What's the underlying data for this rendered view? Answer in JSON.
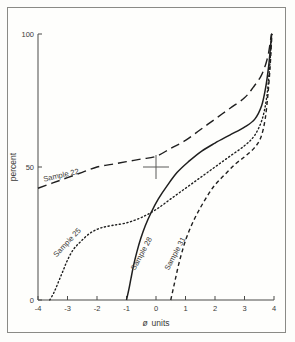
{
  "figure": {
    "border": true,
    "background_color": "#fefefc",
    "ink_color": "#1f1f1f"
  },
  "chart_data": {
    "type": "line",
    "title": "",
    "xlabel": "ø  units",
    "ylabel": "percent",
    "xlim": [
      -4,
      4
    ],
    "ylim": [
      0,
      100
    ],
    "grid": false,
    "legend_position": "inline-curve-labels",
    "x_ticks": [
      -4,
      -3,
      -2,
      -1,
      0,
      1,
      2,
      3,
      4
    ],
    "x_tick_labels": [
      "-4",
      "-3",
      "-2",
      "-1",
      "0",
      "1",
      "2",
      "3",
      "4"
    ],
    "y_ticks": [
      0,
      50,
      100
    ],
    "y_tick_labels": [
      "0",
      "50",
      "100"
    ],
    "annotations": [
      {
        "name": "crosshair-marker",
        "x": 0.0,
        "y": 50,
        "shape": "plus"
      }
    ],
    "series": [
      {
        "name": "Sample 22",
        "label": "Sample 22",
        "style": "long-dash",
        "label_x": -3.2,
        "label_y": 46,
        "label_rotation": -13,
        "points": [
          [
            -4.0,
            42
          ],
          [
            -3.5,
            44
          ],
          [
            -3.0,
            46
          ],
          [
            -2.5,
            48
          ],
          [
            -2.0,
            50
          ],
          [
            -1.5,
            51
          ],
          [
            -1.0,
            52
          ],
          [
            -0.5,
            53
          ],
          [
            0.0,
            54
          ],
          [
            0.5,
            57
          ],
          [
            1.0,
            60
          ],
          [
            1.5,
            64
          ],
          [
            2.0,
            68
          ],
          [
            2.5,
            72
          ],
          [
            3.0,
            76
          ],
          [
            3.3,
            80
          ],
          [
            3.55,
            84
          ],
          [
            3.7,
            88
          ],
          [
            3.8,
            92
          ],
          [
            3.86,
            96
          ],
          [
            3.9,
            99
          ],
          [
            3.92,
            100
          ]
        ]
      },
      {
        "name": "Sample 25",
        "label": "Sample 25",
        "style": "dotted",
        "label_x": -2.95,
        "label_y": 21,
        "label_rotation": -47,
        "points": [
          [
            -3.6,
            0
          ],
          [
            -3.45,
            3
          ],
          [
            -3.3,
            7
          ],
          [
            -3.15,
            11
          ],
          [
            -3.0,
            15
          ],
          [
            -2.8,
            19
          ],
          [
            -2.55,
            22
          ],
          [
            -2.25,
            25
          ],
          [
            -1.9,
            27
          ],
          [
            -1.5,
            28
          ],
          [
            -1.0,
            29
          ],
          [
            -0.5,
            31
          ],
          [
            0.0,
            34
          ],
          [
            0.5,
            38
          ],
          [
            1.0,
            42
          ],
          [
            1.5,
            46
          ],
          [
            2.0,
            50
          ],
          [
            2.5,
            54
          ],
          [
            3.0,
            58
          ],
          [
            3.35,
            62
          ],
          [
            3.6,
            68
          ],
          [
            3.75,
            76
          ],
          [
            3.84,
            86
          ],
          [
            3.89,
            94
          ],
          [
            3.92,
            100
          ]
        ]
      },
      {
        "name": "Sample 28",
        "label": "Sample 28",
        "style": "solid",
        "label_x": -0.42,
        "label_y": 17,
        "label_rotation": -62,
        "points": [
          [
            -1.0,
            0
          ],
          [
            -0.92,
            4
          ],
          [
            -0.85,
            8
          ],
          [
            -0.76,
            13
          ],
          [
            -0.65,
            18
          ],
          [
            -0.52,
            23
          ],
          [
            -0.36,
            28
          ],
          [
            -0.16,
            33
          ],
          [
            0.08,
            38
          ],
          [
            0.38,
            43
          ],
          [
            0.72,
            48
          ],
          [
            1.1,
            52
          ],
          [
            1.55,
            56
          ],
          [
            2.0,
            59
          ],
          [
            2.5,
            62
          ],
          [
            3.0,
            65
          ],
          [
            3.35,
            68
          ],
          [
            3.58,
            73
          ],
          [
            3.72,
            80
          ],
          [
            3.82,
            88
          ],
          [
            3.88,
            95
          ],
          [
            3.92,
            100
          ]
        ]
      },
      {
        "name": "Sample 31",
        "label": "Sample 31",
        "style": "short-dash",
        "label_x": 0.72,
        "label_y": 17,
        "label_rotation": -62,
        "points": [
          [
            0.5,
            0
          ],
          [
            0.58,
            4
          ],
          [
            0.66,
            8
          ],
          [
            0.76,
            13
          ],
          [
            0.88,
            18
          ],
          [
            1.02,
            23
          ],
          [
            1.2,
            28
          ],
          [
            1.42,
            33
          ],
          [
            1.68,
            38
          ],
          [
            1.98,
            43
          ],
          [
            2.32,
            47
          ],
          [
            2.68,
            51
          ],
          [
            3.02,
            54
          ],
          [
            3.32,
            57
          ],
          [
            3.55,
            61
          ],
          [
            3.7,
            68
          ],
          [
            3.8,
            78
          ],
          [
            3.87,
            88
          ],
          [
            3.91,
            96
          ],
          [
            3.93,
            100
          ]
        ]
      }
    ]
  }
}
